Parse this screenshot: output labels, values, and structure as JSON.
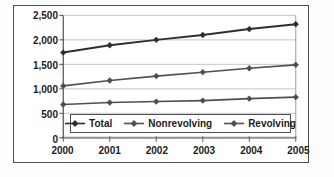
{
  "chart_data": {
    "type": "line",
    "x": [
      2000,
      2001,
      2002,
      2003,
      2004,
      2005
    ],
    "x_tick_labels": [
      "2000",
      "2001",
      "2002",
      "2003",
      "2004",
      "2005"
    ],
    "y_tick_labels_desc": [
      "2,500",
      "2,000",
      "1,500",
      "1,000",
      "500",
      "0"
    ],
    "ylim": [
      0,
      2500
    ],
    "y_step": 500,
    "grid": "horizontal",
    "legend_position": "inside-bottom",
    "series": [
      {
        "name": "Total",
        "marker": "diamond",
        "color": "#2e2e2e",
        "line_width": 2,
        "values": [
          1740,
          1890,
          2000,
          2100,
          2220,
          2320
        ]
      },
      {
        "name": "Nonrevolving",
        "marker": "diamond",
        "color": "#4f4f4f",
        "line_width": 1.6,
        "values": [
          1060,
          1170,
          1260,
          1340,
          1420,
          1490
        ]
      },
      {
        "name": "Revolving",
        "marker": "diamond",
        "color": "#4f4f4f",
        "line_width": 1.6,
        "values": [
          680,
          720,
          740,
          760,
          800,
          830
        ]
      }
    ]
  },
  "theme": {
    "background": "#ffffff",
    "frame_border": "#4e4e4e",
    "grid_color": "#c6c6c6",
    "axis_color": "#4d4d4d",
    "baseline_color": "#8f8f8f",
    "right_border_color": "#9b9b9b",
    "tick_color": "#5a5a5a",
    "text_color": "#1c1c1c",
    "legend_border": "#4e4e4e"
  }
}
